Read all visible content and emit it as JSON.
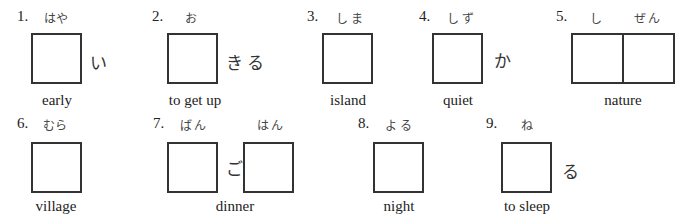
{
  "items": [
    {
      "number": "1.",
      "readings": [
        "はや"
      ],
      "okurigana": "い",
      "meaning": "early"
    },
    {
      "number": "2.",
      "readings": [
        "お"
      ],
      "okurigana": "きる",
      "meaning": "to get up"
    },
    {
      "number": "3.",
      "readings": [
        "しま"
      ],
      "okurigana": "",
      "meaning": "island"
    },
    {
      "number": "4.",
      "readings": [
        "しず"
      ],
      "okurigana": "か",
      "meaning": "quiet"
    },
    {
      "number": "5.",
      "readings": [
        "し",
        "ぜん"
      ],
      "okurigana": "",
      "meaning": "nature"
    },
    {
      "number": "6.",
      "readings": [
        "むら"
      ],
      "okurigana": "",
      "meaning": "village"
    },
    {
      "number": "7.",
      "readings": [
        "ばん",
        "はん"
      ],
      "okurigana": "ご",
      "meaning": "dinner"
    },
    {
      "number": "8.",
      "readings": [
        "よる"
      ],
      "okurigana": "",
      "meaning": "night"
    },
    {
      "number": "9.",
      "readings": [
        "ね"
      ],
      "okurigana": "る",
      "meaning": "to sleep"
    }
  ]
}
